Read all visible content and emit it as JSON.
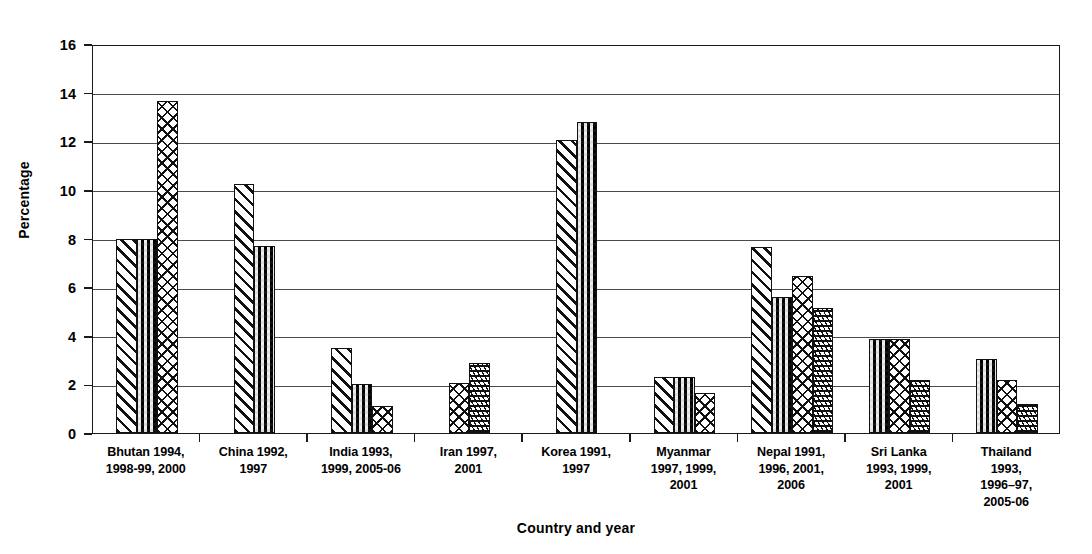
{
  "chart_data": {
    "type": "bar",
    "title": "",
    "xlabel": "Country and year",
    "ylabel": "Percentage",
    "ylim": [
      0,
      16
    ],
    "ytick_labels": [
      "0",
      "2",
      "4",
      "6",
      "8",
      "10",
      "12",
      "14",
      "16"
    ],
    "ytick_values": [
      0,
      2,
      4,
      6,
      8,
      10,
      12,
      14,
      16
    ],
    "grid": "horizontal",
    "legend": "none",
    "categories": [
      "Bhutan 1994, 1998-99, 2000",
      "China 1992, 1997",
      "India 1993, 1999, 2005-06",
      "Iran 1997, 2001",
      "Korea 1991, 1997",
      "Myanmar 1997, 1999, 2001",
      "Nepal 1991, 1996, 2001, 2006",
      "Sri Lanka 1993, 1999, 2001",
      "Thailand 1993, 1996–97, 2005-06"
    ],
    "category_label_lines": [
      [
        "Bhutan 1994,",
        "1998-99, 2000"
      ],
      [
        "China 1992,",
        "1997"
      ],
      [
        "India 1993,",
        "1999, 2005-06"
      ],
      [
        "Iran 1997,",
        "2001"
      ],
      [
        "Korea 1991,",
        "1997"
      ],
      [
        "Myanmar",
        "1997, 1999,",
        "2001"
      ],
      [
        "Nepal 1991,",
        "1996, 2001,",
        "2006"
      ],
      [
        "Sri Lanka",
        "1993, 1999,",
        "2001"
      ],
      [
        "Thailand",
        "1993,",
        "1996–97,",
        "2005-06"
      ]
    ],
    "patterns": {
      "diag": "forward-diagonal-hatch",
      "check": "dense-checkerboard",
      "cross": "diagonal-crosshatch",
      "wave": "horizontal-wave"
    },
    "groups": [
      {
        "name": "Bhutan",
        "bars": [
          {
            "value": 8.0,
            "pattern": "diag"
          },
          {
            "value": 8.0,
            "pattern": "check"
          },
          {
            "value": 13.65,
            "pattern": "cross"
          }
        ]
      },
      {
        "name": "China",
        "bars": [
          {
            "value": 10.25,
            "pattern": "diag"
          },
          {
            "value": 7.7,
            "pattern": "check"
          }
        ]
      },
      {
        "name": "India",
        "bars": [
          {
            "value": 3.5,
            "pattern": "diag"
          },
          {
            "value": 2.0,
            "pattern": "check"
          },
          {
            "value": 1.1,
            "pattern": "cross"
          }
        ]
      },
      {
        "name": "Iran",
        "bars": [
          {
            "value": 2.05,
            "pattern": "cross"
          },
          {
            "value": 2.9,
            "pattern": "wave"
          }
        ]
      },
      {
        "name": "Korea",
        "bars": [
          {
            "value": 12.05,
            "pattern": "diag"
          },
          {
            "value": 12.8,
            "pattern": "check"
          }
        ]
      },
      {
        "name": "Myanmar",
        "bars": [
          {
            "value": 2.3,
            "pattern": "diag"
          },
          {
            "value": 2.3,
            "pattern": "check"
          },
          {
            "value": 1.65,
            "pattern": "cross"
          }
        ]
      },
      {
        "name": "Nepal",
        "bars": [
          {
            "value": 7.65,
            "pattern": "diag"
          },
          {
            "value": 5.6,
            "pattern": "check"
          },
          {
            "value": 6.45,
            "pattern": "cross"
          },
          {
            "value": 5.15,
            "pattern": "wave"
          }
        ]
      },
      {
        "name": "Sri Lanka",
        "bars": [
          {
            "value": 3.85,
            "pattern": "check"
          },
          {
            "value": 3.85,
            "pattern": "cross"
          },
          {
            "value": 2.2,
            "pattern": "wave"
          }
        ]
      },
      {
        "name": "Thailand",
        "bars": [
          {
            "value": 3.05,
            "pattern": "check"
          },
          {
            "value": 2.2,
            "pattern": "cross"
          },
          {
            "value": 1.2,
            "pattern": "wave"
          }
        ]
      }
    ]
  },
  "axes": {
    "y_title": "Percentage",
    "x_title": "Country and year"
  },
  "colors": {
    "ink": "#111111",
    "grid": "#4a4a4a",
    "background": "#ffffff"
  }
}
